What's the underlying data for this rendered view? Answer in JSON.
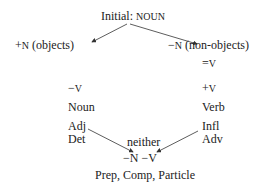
{
  "diagram": {
    "root": {
      "prefix": "Initial:",
      "value": "NOUN"
    },
    "left_branch": {
      "feature_sign": "+",
      "feature": "N",
      "label": "(objects)"
    },
    "right_branch": {
      "feature_sign": "−",
      "feature": "N",
      "label": "(non-objects)"
    },
    "right_eq": {
      "sign": "=",
      "feature": "V"
    },
    "left_v": {
      "sign": "−",
      "feature": "V"
    },
    "right_v": {
      "sign": "+",
      "feature": "V"
    },
    "left_categories": [
      "Noun",
      "Adj",
      "Det"
    ],
    "right_categories": [
      "Verb",
      "Infl",
      "Adv"
    ],
    "neither_label": "neither",
    "bottom_features": {
      "n": "−N",
      "v": "−V"
    },
    "bottom_categories": "Prep, Comp, Particle"
  },
  "colors": {
    "text": "#222222",
    "line": "#333333",
    "background": "#ffffff"
  }
}
